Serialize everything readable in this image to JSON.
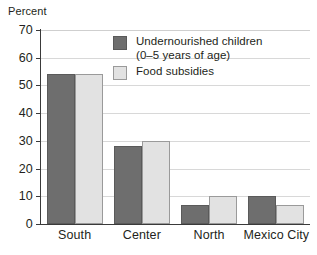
{
  "chart_data": {
    "type": "bar",
    "title": "",
    "xlabel": "",
    "ylabel": "Percent",
    "ylim": [
      0,
      70
    ],
    "yticks": [
      0,
      10,
      20,
      30,
      40,
      50,
      60,
      70
    ],
    "grid": true,
    "legend_position": "inside-top-center",
    "categories": [
      "South",
      "Center",
      "North",
      "Mexico City"
    ],
    "series": [
      {
        "name": "Undernourished children (0–5 years of age)",
        "name_line1": "Undernourished children",
        "name_line2": "(0–5 years of age)",
        "color": "#6e6e6e",
        "values": [
          54,
          28,
          7,
          10
        ]
      },
      {
        "name": "Food subsidies",
        "name_line1": "Food subsidies",
        "name_line2": "",
        "color": "#e2e2e2",
        "values": [
          54,
          30,
          10,
          7
        ]
      }
    ]
  },
  "axis": {
    "y_title": "Percent",
    "tick_0": "0",
    "tick_10": "10",
    "tick_20": "20",
    "tick_30": "30",
    "tick_40": "40",
    "tick_50": "50",
    "tick_60": "60",
    "tick_70": "70"
  },
  "categories": {
    "c0": "South",
    "c1": "Center",
    "c2": "North",
    "c3": "Mexico City"
  },
  "legend": {
    "item0_line1": "Undernourished children",
    "item0_line2": "(0–5 years of age)",
    "item1_line1": "Food subsidies"
  },
  "colors": {
    "series_dark": "#6e6e6e",
    "series_light": "#e2e2e2",
    "gridline": "#d8d8d8",
    "axis": "#3a3a3a",
    "text": "#231f20"
  }
}
